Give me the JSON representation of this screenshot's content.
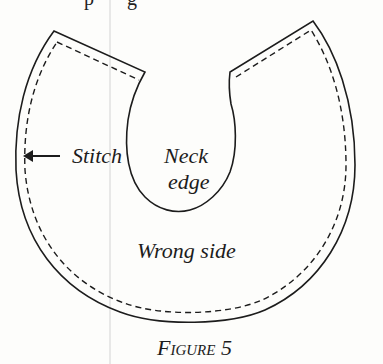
{
  "figure": {
    "caption": "Figure 5",
    "labels": {
      "stitch": "Stitch",
      "neck_line1": "Neck",
      "neck_line2": "edge",
      "wrong_side": "Wrong side"
    },
    "top_text_fragment_left": "p",
    "top_text_fragment_right": "g",
    "colors": {
      "ink": "#1c1c1c",
      "paper": "#fdfdfb",
      "gutter": "#d8d8d8"
    }
  }
}
